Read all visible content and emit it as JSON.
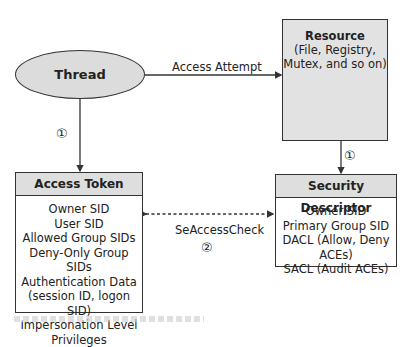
{
  "diagram": {
    "thread": {
      "label": "Thread"
    },
    "resource": {
      "title": "Resource",
      "subtitle_line1": "(File, Registry,",
      "subtitle_line2": "Mutex, and so on)",
      "icon": "database-cylinder-icon"
    },
    "access_attempt_label": "Access Attempt",
    "access_token": {
      "title": "Access Token",
      "items": [
        "Owner SID",
        "User SID",
        "Allowed Group SIDs",
        "Deny-Only Group SIDs",
        "Authentication Data",
        "(session ID, logon SID)",
        "Impersonation Level",
        "Privileges"
      ]
    },
    "security_descriptor": {
      "title": "Security Descriptor",
      "items": [
        "Owner SID",
        "Primary Group SID",
        "DACL (Allow, Deny ACEs)",
        "SACL (Audit ACEs)"
      ]
    },
    "check_label": "SeAccessCheck",
    "steps": {
      "thread_to_token": "①",
      "resource_to_sd": "①",
      "check": "②"
    },
    "colors": {
      "fill_gray": "#dcdcdc",
      "stroke": "#333333"
    }
  }
}
